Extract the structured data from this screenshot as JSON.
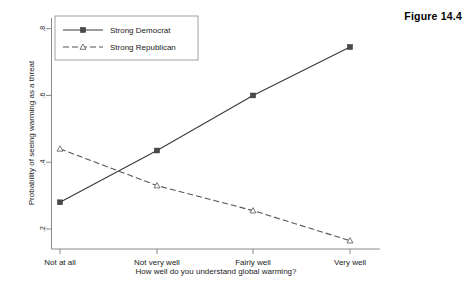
{
  "figure": {
    "label": "Figure 14.4"
  },
  "chart_data": {
    "type": "line",
    "title": "",
    "xlabel": "How well do you understand global warming?",
    "ylabel": "Probability of seeing warming as a threat",
    "categories": [
      "Not at all",
      "Not very well",
      "Fairly well",
      "Very well"
    ],
    "yticks": [
      0.2,
      0.4,
      0.6,
      0.8
    ],
    "ytick_labels": [
      ".2",
      ".4",
      ".6",
      ".8"
    ],
    "ylim": [
      0.14,
      0.82
    ],
    "grid": false,
    "legend_position": "top-left",
    "series": [
      {
        "name": "Strong Democrat",
        "style": "solid",
        "marker": "square",
        "values": [
          0.28,
          0.435,
          0.6,
          0.745
        ]
      },
      {
        "name": "Strong Republican",
        "style": "dashed",
        "marker": "triangle",
        "values": [
          0.44,
          0.33,
          0.255,
          0.165
        ]
      }
    ]
  }
}
